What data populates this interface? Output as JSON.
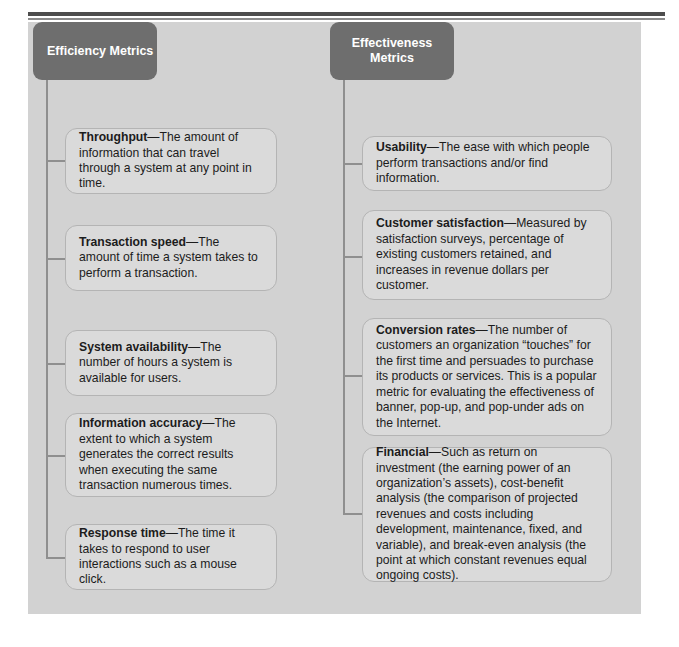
{
  "figure": {
    "panel_color": "#d2d2d2",
    "header_color": "#6e6e6e",
    "box_color": "#dadada",
    "connector_color": "#8f8f8f"
  },
  "columns": [
    {
      "id": "efficiency",
      "header": "Efficiency Metrics",
      "metrics": [
        {
          "term": "Throughput",
          "dash": "—",
          "definition": "The amount of information that can travel through a system at any point in time."
        },
        {
          "term": "Transaction speed",
          "dash": "—",
          "definition": "The amount of time a system takes to perform a transaction."
        },
        {
          "term": "System availability",
          "dash": "—",
          "definition": "The number of hours a system is available for users."
        },
        {
          "term": "Information accuracy",
          "dash": "—",
          "definition": "The extent to which a system generates the correct results when executing the same transaction numerous times."
        },
        {
          "term": "Response time",
          "dash": "—",
          "definition": "The time it takes to respond to user interactions such as a mouse click."
        }
      ]
    },
    {
      "id": "effectiveness",
      "header": "Effectiveness\nMetrics",
      "metrics": [
        {
          "term": "Usability",
          "dash": "—",
          "definition": "The ease with which people perform transactions and/or find information."
        },
        {
          "term": "Customer satisfaction",
          "dash": "—",
          "definition": "Measured by satisfaction surveys, percentage of existing customers retained, and increases in revenue dollars per customer."
        },
        {
          "term": "Conversion rates",
          "dash": "—",
          "definition": "The number of customers an organization “touches” for the first time and persuades to purchase its products or services. This is a popular metric for evaluating the effectiveness of banner, pop-up, and pop-under ads on the Internet."
        },
        {
          "term": "Financial",
          "dash": "—",
          "definition": "Such as return on investment (the earning power of an organization’s assets), cost-benefit analysis (the comparison of projected revenues and costs including development, maintenance, fixed, and variable), and break-even analysis (the point at which constant revenues equal ongoing costs)."
        }
      ]
    }
  ]
}
